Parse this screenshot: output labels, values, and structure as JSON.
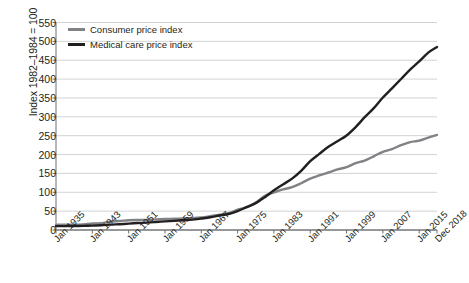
{
  "chart_data": {
    "type": "line",
    "title": "",
    "subtitle": "",
    "xlabel": "",
    "ylabel": "Index 1982–1984 = 100",
    "ylim": [
      0,
      550
    ],
    "ytick_values": [
      0,
      50,
      100,
      150,
      200,
      250,
      300,
      350,
      400,
      450,
      500,
      550
    ],
    "ytick_labels": [
      "0",
      "50",
      "100",
      "150",
      "200",
      "250",
      "300",
      "350",
      "400",
      "450",
      "500",
      "550"
    ],
    "xlim": [
      1935,
      2018.92
    ],
    "xtick_labels": [
      "Jan 1935",
      "Jan 1943",
      "Jan 1951",
      "Jan 1959",
      "Jan 1967",
      "Jan 1975",
      "Jan 1983",
      "Jan 1991",
      "Jan 1999",
      "Jan 2007",
      "Jan 2015",
      "Dec 2018"
    ],
    "xtick_positions": [
      1935,
      1943,
      1951,
      1959,
      1967,
      1975,
      1983,
      1991,
      1999,
      2007,
      2015,
      2018.92
    ],
    "grid": "horizontal",
    "legend_position": "top-left-inside",
    "x": [
      1935,
      1937,
      1939,
      1941,
      1943,
      1945,
      1947,
      1949,
      1951,
      1953,
      1955,
      1957,
      1959,
      1961,
      1963,
      1965,
      1967,
      1969,
      1971,
      1973,
      1975,
      1977,
      1979,
      1981,
      1983,
      1985,
      1987,
      1989,
      1991,
      1993,
      1995,
      1997,
      1999,
      2001,
      2003,
      2005,
      2007,
      2009,
      2011,
      2013,
      2015,
      2017,
      2018.92
    ],
    "series": [
      {
        "name": "Consumer price index",
        "color": "#808285",
        "values": [
          13.6,
          14.1,
          13.9,
          14.7,
          17.3,
          18.0,
          22.3,
          23.8,
          26.0,
          26.7,
          26.8,
          28.1,
          29.1,
          29.9,
          30.6,
          31.5,
          33.4,
          36.7,
          40.5,
          44.4,
          53.8,
          60.6,
          72.6,
          90.9,
          99.6,
          107.6,
          113.6,
          124.0,
          136.2,
          144.5,
          152.4,
          160.5,
          166.6,
          177.1,
          184.0,
          195.3,
          207.3,
          214.5,
          224.9,
          233.0,
          237.0,
          245.1,
          252.0
        ]
      },
      {
        "name": "Medical care price index",
        "color": "#231f20",
        "values": [
          10.2,
          10.4,
          10.5,
          10.9,
          11.7,
          12.5,
          14.2,
          15.4,
          16.9,
          18.4,
          19.5,
          21.1,
          22.9,
          24.3,
          26.0,
          27.4,
          30.4,
          33.7,
          38.4,
          42.3,
          50.1,
          60.7,
          71.2,
          87.0,
          105.1,
          120.9,
          136.2,
          156.8,
          182.4,
          201.8,
          220.7,
          235.4,
          250.6,
          272.8,
          299.1,
          323.2,
          351.1,
          375.6,
          400.3,
          425.1,
          446.8,
          470.0,
          485.0
        ]
      }
    ]
  },
  "legend": {
    "items": [
      {
        "label": "Consumer price index",
        "color": "#808285"
      },
      {
        "label": "Medical care price index",
        "color": "#231f20"
      }
    ]
  },
  "axes": {
    "y_axis_title": "Index 1982–1984 = 100"
  }
}
